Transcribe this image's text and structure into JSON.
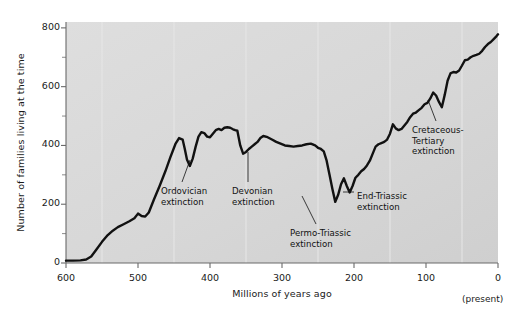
{
  "figure": {
    "background_color": "#ffffff",
    "plot_background_color": "#d8d8d8",
    "line_color": "#111111",
    "axis_color": "#555555",
    "gridline_color": "#e8e8e8"
  },
  "axes": {
    "ylabel": "Number of families living at the time",
    "xlabel": "Millions of years ago",
    "present_note": "(present)",
    "yticks": [
      0,
      200,
      400,
      600,
      800
    ],
    "yticks_labels": [
      "0",
      "200",
      "400",
      "600",
      "800"
    ],
    "yminor": [
      100,
      300,
      500,
      700
    ],
    "xticks": [
      600,
      500,
      400,
      300,
      200,
      100,
      0
    ],
    "xticks_labels": [
      "600",
      "500",
      "400",
      "300",
      "200",
      "100",
      "0"
    ],
    "xminor": [
      550,
      450,
      350,
      250,
      150,
      50
    ]
  },
  "annotations": [
    {
      "id": "ordovician",
      "lines": [
        "Ordovician",
        "extinction"
      ],
      "x": 161,
      "y": 186
    },
    {
      "id": "devonian",
      "lines": [
        "Devonian",
        "extinction"
      ],
      "x": 232,
      "y": 186
    },
    {
      "id": "permo-triassic",
      "lines": [
        "Permo-Triassic",
        "extinction"
      ],
      "x": 290,
      "y": 228
    },
    {
      "id": "end-triassic",
      "lines": [
        "End-Triassic",
        "extinction"
      ],
      "x": 357,
      "y": 191
    },
    {
      "id": "cretaceous-tertiary",
      "lines": [
        "Cretaceous-",
        "Tertiary",
        "extinction"
      ],
      "x": 412,
      "y": 125
    }
  ],
  "chart_data": {
    "type": "line",
    "title": "",
    "xlabel": "Millions of years ago",
    "ylabel": "Number of families living at the time",
    "xlim": [
      600,
      0
    ],
    "ylim": [
      0,
      820
    ],
    "x_axis_reversed": true,
    "grid": "vertical-minor-only",
    "legend": "none",
    "series": [
      {
        "name": "Number of families",
        "x": [
          600,
          590,
          580,
          572,
          565,
          558,
          550,
          542,
          535,
          528,
          520,
          512,
          505,
          500,
          495,
          490,
          485,
          478,
          470,
          462,
          455,
          448,
          443,
          438,
          435,
          432,
          428,
          424,
          420,
          416,
          412,
          408,
          404,
          400,
          396,
          392,
          388,
          384,
          380,
          376,
          372,
          368,
          365,
          362,
          358,
          354,
          350,
          346,
          342,
          338,
          334,
          330,
          326,
          320,
          314,
          308,
          302,
          296,
          290,
          284,
          278,
          272,
          266,
          260,
          254,
          250,
          246,
          242,
          238,
          234,
          230,
          226,
          222,
          218,
          214,
          210,
          206,
          202,
          198,
          194,
          190,
          186,
          182,
          178,
          174,
          170,
          166,
          162,
          158,
          154,
          150,
          146,
          142,
          138,
          134,
          130,
          126,
          122,
          118,
          114,
          110,
          106,
          102,
          98,
          94,
          90,
          86,
          82,
          78,
          74,
          70,
          66,
          62,
          58,
          54,
          50,
          46,
          42,
          38,
          34,
          30,
          26,
          22,
          18,
          14,
          10,
          6,
          2,
          0
        ],
        "y": [
          8,
          8,
          9,
          12,
          22,
          45,
          72,
          95,
          110,
          122,
          132,
          142,
          152,
          168,
          160,
          158,
          172,
          215,
          262,
          312,
          360,
          405,
          425,
          420,
          388,
          352,
          330,
          355,
          395,
          430,
          445,
          442,
          430,
          428,
          440,
          452,
          456,
          452,
          460,
          462,
          460,
          455,
          452,
          450,
          400,
          372,
          378,
          388,
          396,
          404,
          412,
          425,
          432,
          428,
          420,
          412,
          406,
          400,
          398,
          396,
          398,
          400,
          404,
          406,
          400,
          392,
          388,
          380,
          348,
          300,
          252,
          208,
          232,
          268,
          288,
          262,
          240,
          262,
          290,
          300,
          312,
          320,
          332,
          348,
          372,
          396,
          404,
          408,
          412,
          420,
          440,
          472,
          458,
          452,
          456,
          468,
          480,
          496,
          508,
          512,
          520,
          528,
          540,
          545,
          560,
          580,
          570,
          548,
          530,
          572,
          620,
          645,
          650,
          648,
          655,
          672,
          690,
          692,
          700,
          705,
          708,
          712,
          722,
          735,
          745,
          752,
          762,
          772,
          778
        ]
      }
    ],
    "extinction_events": [
      {
        "name": "Ordovician extinction",
        "x": 440,
        "approx_y": 330
      },
      {
        "name": "Devonian extinction",
        "x": 360,
        "approx_y": 372
      },
      {
        "name": "Permo-Triassic extinction",
        "x": 230,
        "approx_y": 208
      },
      {
        "name": "End-Triassic extinction",
        "x": 205,
        "approx_y": 240
      },
      {
        "name": "Cretaceous-Tertiary extinction",
        "x": 65,
        "approx_y": 530
      }
    ]
  }
}
